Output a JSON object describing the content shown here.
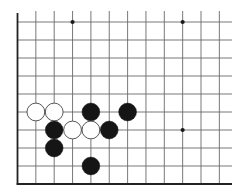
{
  "board": {
    "description": "Go board corner fragment (left and bottom edges)",
    "columns": 12,
    "rows": 10,
    "origin_x": 17.5,
    "origin_y": 22,
    "col_spacing": 18.35,
    "row_spacing": 18.0,
    "line_extent_right": 232,
    "line_extent_top": 11,
    "colors": {
      "background": "#ffffff",
      "grid_line": "#6a6a6a",
      "edge_line": "#222222",
      "black_stone": "#151515",
      "white_stone_fill": "#ffffff",
      "white_stone_stroke": "#444444",
      "star_point": "#1a1a1a"
    },
    "star_points": [
      {
        "col": 3,
        "row": 0
      },
      {
        "col": 9,
        "row": 0
      },
      {
        "col": 9,
        "row": 6
      }
    ],
    "stones": [
      {
        "color": "white",
        "col": 1,
        "row": 5
      },
      {
        "color": "white",
        "col": 2,
        "row": 5
      },
      {
        "color": "black",
        "col": 4,
        "row": 5
      },
      {
        "color": "black",
        "col": 6,
        "row": 5
      },
      {
        "color": "black",
        "col": 2,
        "row": 6
      },
      {
        "color": "white",
        "col": 3,
        "row": 6
      },
      {
        "color": "white",
        "col": 4,
        "row": 6
      },
      {
        "color": "black",
        "col": 5,
        "row": 6
      },
      {
        "color": "black",
        "col": 2,
        "row": 7
      },
      {
        "color": "black",
        "col": 4,
        "row": 8
      }
    ]
  }
}
